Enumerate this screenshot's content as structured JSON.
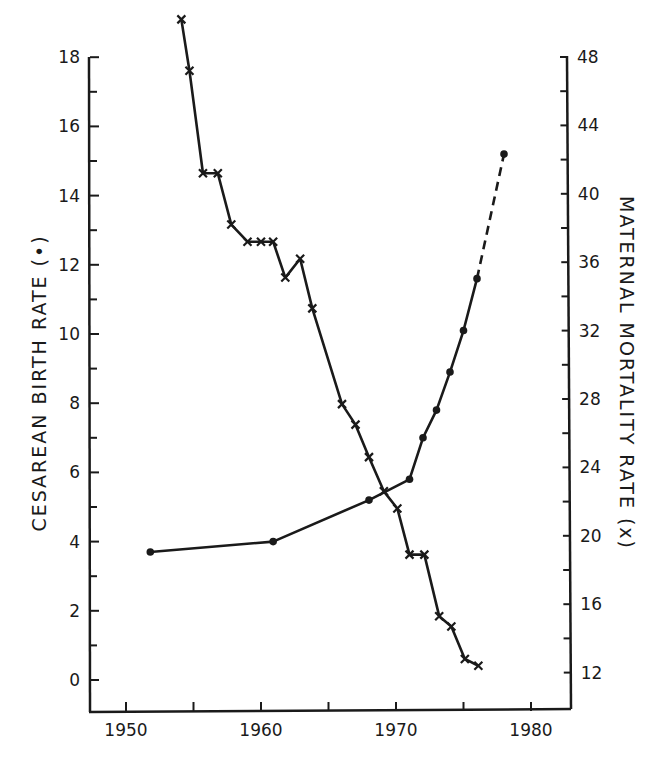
{
  "chart_data": {
    "type": "line",
    "title": "",
    "xlabel": "",
    "ylabel": "CESAREAN BIRTH RATE (•)",
    "y2label": "MATERNAL MORTALITY RATE (x)",
    "xlim": [
      1948,
      1983
    ],
    "ylim": [
      -1,
      18
    ],
    "y2lim": [
      10.2,
      48
    ],
    "x_ticks": [
      1950,
      1955,
      1960,
      1965,
      1970,
      1975,
      1980
    ],
    "x_tick_labels": [
      "1950",
      "1960",
      "1970",
      "1980"
    ],
    "y_ticks": [
      0,
      1,
      2,
      3,
      4,
      5,
      6,
      7,
      8,
      9,
      10,
      11,
      12,
      13,
      14,
      15,
      16,
      17,
      18
    ],
    "y_tick_labels": [
      "0",
      "2",
      "4",
      "6",
      "8",
      "10",
      "12",
      "14",
      "16",
      "18"
    ],
    "y2_ticks": [
      12,
      14,
      16,
      18,
      20,
      22,
      24,
      26,
      28,
      30,
      32,
      34,
      36,
      38,
      40,
      42,
      44,
      46,
      48
    ],
    "y2_tick_labels": [
      "12",
      "16",
      "20",
      "24",
      "28",
      "32",
      "36",
      "40",
      "44",
      "48"
    ],
    "grid": false,
    "legend": "none (markers identified in axis titles)",
    "series": [
      {
        "name": "Cesarean birth rate",
        "axis": "left",
        "marker": "dot",
        "x": [
          1951.8,
          1960.9,
          1968.0,
          1971.0,
          1972.0,
          1973.0,
          1974.0,
          1975.0,
          1976.0,
          1978.0
        ],
        "values": [
          3.7,
          4.0,
          5.2,
          5.8,
          7.0,
          7.8,
          8.9,
          10.1,
          11.6,
          15.2
        ],
        "dashed_last_segment": true
      },
      {
        "name": "Maternal mortality rate",
        "axis": "right",
        "marker": "x",
        "x": [
          1954.1,
          1954.7,
          1955.7,
          1956.8,
          1957.8,
          1959.0,
          1960.0,
          1960.9,
          1961.8,
          1962.9,
          1963.8,
          1966.0,
          1967.0,
          1968.0,
          1969.1,
          1970.1,
          1971.0,
          1972.1,
          1973.2,
          1974.1,
          1975.1,
          1976.1
        ],
        "values": [
          50.2,
          47.2,
          41.2,
          41.2,
          38.2,
          37.2,
          37.2,
          37.2,
          35.1,
          36.2,
          33.3,
          27.7,
          26.5,
          24.6,
          22.6,
          21.6,
          18.9,
          18.9,
          15.3,
          14.7,
          12.8,
          12.4
        ]
      }
    ]
  },
  "axes": {
    "left_title": "CESAREAN  BIRTH  RATE  (•)",
    "right_title": "MATERNAL  MORTALITY  RATE  (x)"
  },
  "style": {
    "ink": "#1a1a1a",
    "background": "#ffffff"
  }
}
